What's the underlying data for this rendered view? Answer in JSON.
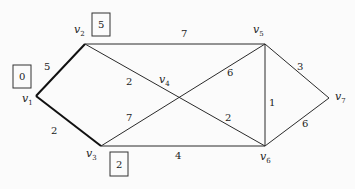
{
  "graph": {
    "vertices": [
      {
        "id": "v1",
        "label": "v",
        "sub": "1",
        "x": 36,
        "y": 96
      },
      {
        "id": "v2",
        "label": "v",
        "sub": "2",
        "x": 85,
        "y": 44
      },
      {
        "id": "v3",
        "label": "v",
        "sub": "3",
        "x": 101,
        "y": 146
      },
      {
        "id": "v4",
        "label": "v",
        "sub": "4",
        "x": 178,
        "y": 99
      },
      {
        "id": "v5",
        "label": "v",
        "sub": "5",
        "x": 265,
        "y": 44
      },
      {
        "id": "v6",
        "label": "v",
        "sub": "6",
        "x": 265,
        "y": 146
      },
      {
        "id": "v7",
        "label": "v",
        "sub": "7",
        "x": 329,
        "y": 98
      }
    ],
    "edges": [
      {
        "from": "v1",
        "to": "v2",
        "weight": "5",
        "bold": true
      },
      {
        "from": "v1",
        "to": "v3",
        "weight": "2",
        "bold": true
      },
      {
        "from": "v2",
        "to": "v5",
        "weight": "7",
        "bold": false
      },
      {
        "from": "v2",
        "to": "v6",
        "weight": "2",
        "bold": false
      },
      {
        "from": "v3",
        "to": "v5",
        "weight": "6",
        "bold": false
      },
      {
        "from": "v3",
        "to": "v5",
        "weight_alt": "7",
        "bold": false
      },
      {
        "from": "v3",
        "to": "v6",
        "weight": "4",
        "bold": false
      },
      {
        "from": "v5",
        "to": "v6",
        "weight": "1",
        "bold": false
      },
      {
        "from": "v5",
        "to": "v7",
        "weight": "3",
        "bold": false
      },
      {
        "from": "v6",
        "to": "v7",
        "weight": "6",
        "bold": false
      }
    ],
    "edge_labels": {
      "v1v2": "5",
      "v1v3": "2",
      "v2v5": "7",
      "v2v4": "2",
      "v4v5": "6",
      "v3v4": "7",
      "v4v6": "2",
      "v3v6": "4",
      "v5v6": "1",
      "v5v7": "3",
      "v6v7": "6"
    },
    "distance_boxes": {
      "v1": "0",
      "v2": "5",
      "v3": "2"
    },
    "vertex_letter": "v",
    "subs": {
      "v1": "1",
      "v2": "2",
      "v3": "3",
      "v4": "4",
      "v5": "5",
      "v6": "6",
      "v7": "7"
    }
  }
}
